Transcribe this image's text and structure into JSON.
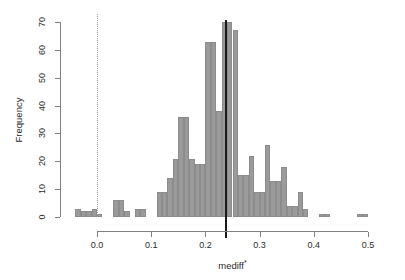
{
  "chart_data": {
    "type": "bar",
    "title": "",
    "subtitle": "",
    "xlabel": "mediff*",
    "xlabel_base": "mediff",
    "xlabel_sup": "*",
    "ylabel": "Frequency",
    "xlim": [
      -0.045,
      0.505
    ],
    "ylim": [
      0,
      72
    ],
    "grid": false,
    "legend": null,
    "bin_width": 0.01,
    "bar_fill_color": "#9a9a9a",
    "bar_border_color": "#8c8c8c",
    "axis_color": "#808080",
    "xticks": [
      {
        "value": 0.0,
        "label": "0.0"
      },
      {
        "value": 0.1,
        "label": "0.1"
      },
      {
        "value": 0.2,
        "label": "0.2"
      },
      {
        "value": 0.3,
        "label": "0.3"
      },
      {
        "value": 0.4,
        "label": "0.4"
      },
      {
        "value": 0.5,
        "label": "0.5"
      }
    ],
    "yticks": [
      {
        "value": 0,
        "label": "0"
      },
      {
        "value": 10,
        "label": "10"
      },
      {
        "value": 20,
        "label": "20"
      },
      {
        "value": 30,
        "label": "30"
      },
      {
        "value": 40,
        "label": "40"
      },
      {
        "value": 50,
        "label": "50"
      },
      {
        "value": 60,
        "label": "60"
      },
      {
        "value": 70,
        "label": "70"
      }
    ],
    "reference_lines": [
      {
        "name": "zero-line",
        "x": 0.0,
        "style": "dotted",
        "color": "#9a9a9a",
        "width": 1
      },
      {
        "name": "observed-line",
        "x": 0.237,
        "style": "solid",
        "color": "#1a1a1a",
        "width": 2
      }
    ],
    "bins": [
      {
        "x0": -0.04,
        "x1": -0.03,
        "count": 3
      },
      {
        "x0": -0.03,
        "x1": -0.02,
        "count": 2
      },
      {
        "x0": -0.02,
        "x1": -0.01,
        "count": 2
      },
      {
        "x0": -0.01,
        "x1": 0.0,
        "count": 3
      },
      {
        "x0": 0.0,
        "x1": 0.01,
        "count": 1
      },
      {
        "x0": 0.01,
        "x1": 0.02,
        "count": 0
      },
      {
        "x0": 0.02,
        "x1": 0.03,
        "count": 0
      },
      {
        "x0": 0.03,
        "x1": 0.04,
        "count": 6
      },
      {
        "x0": 0.04,
        "x1": 0.05,
        "count": 6
      },
      {
        "x0": 0.05,
        "x1": 0.06,
        "count": 2
      },
      {
        "x0": 0.06,
        "x1": 0.07,
        "count": 0
      },
      {
        "x0": 0.07,
        "x1": 0.08,
        "count": 3
      },
      {
        "x0": 0.08,
        "x1": 0.09,
        "count": 3
      },
      {
        "x0": 0.09,
        "x1": 0.1,
        "count": 0
      },
      {
        "x0": 0.1,
        "x1": 0.11,
        "count": 0
      },
      {
        "x0": 0.11,
        "x1": 0.12,
        "count": 9
      },
      {
        "x0": 0.12,
        "x1": 0.13,
        "count": 9
      },
      {
        "x0": 0.13,
        "x1": 0.14,
        "count": 14
      },
      {
        "x0": 0.14,
        "x1": 0.15,
        "count": 21
      },
      {
        "x0": 0.15,
        "x1": 0.16,
        "count": 36
      },
      {
        "x0": 0.16,
        "x1": 0.17,
        "count": 36
      },
      {
        "x0": 0.17,
        "x1": 0.18,
        "count": 21
      },
      {
        "x0": 0.18,
        "x1": 0.19,
        "count": 19
      },
      {
        "x0": 0.19,
        "x1": 0.2,
        "count": 19
      },
      {
        "x0": 0.2,
        "x1": 0.21,
        "count": 63
      },
      {
        "x0": 0.21,
        "x1": 0.22,
        "count": 63
      },
      {
        "x0": 0.22,
        "x1": 0.23,
        "count": 38
      },
      {
        "x0": 0.23,
        "x1": 0.24,
        "count": 70
      },
      {
        "x0": 0.24,
        "x1": 0.25,
        "count": 70
      },
      {
        "x0": 0.25,
        "x1": 0.26,
        "count": 67
      },
      {
        "x0": 0.26,
        "x1": 0.27,
        "count": 15
      },
      {
        "x0": 0.27,
        "x1": 0.28,
        "count": 15
      },
      {
        "x0": 0.28,
        "x1": 0.29,
        "count": 22
      },
      {
        "x0": 0.29,
        "x1": 0.3,
        "count": 9
      },
      {
        "x0": 0.3,
        "x1": 0.31,
        "count": 9
      },
      {
        "x0": 0.31,
        "x1": 0.32,
        "count": 26
      },
      {
        "x0": 0.32,
        "x1": 0.33,
        "count": 13
      },
      {
        "x0": 0.33,
        "x1": 0.34,
        "count": 13
      },
      {
        "x0": 0.34,
        "x1": 0.35,
        "count": 18
      },
      {
        "x0": 0.35,
        "x1": 0.36,
        "count": 4
      },
      {
        "x0": 0.36,
        "x1": 0.37,
        "count": 4
      },
      {
        "x0": 0.37,
        "x1": 0.38,
        "count": 9
      },
      {
        "x0": 0.38,
        "x1": 0.39,
        "count": 3
      },
      {
        "x0": 0.39,
        "x1": 0.4,
        "count": 0
      },
      {
        "x0": 0.4,
        "x1": 0.41,
        "count": 0
      },
      {
        "x0": 0.41,
        "x1": 0.42,
        "count": 1
      },
      {
        "x0": 0.42,
        "x1": 0.43,
        "count": 1
      },
      {
        "x0": 0.43,
        "x1": 0.44,
        "count": 0
      },
      {
        "x0": 0.48,
        "x1": 0.49,
        "count": 1
      },
      {
        "x0": 0.49,
        "x1": 0.5,
        "count": 1
      }
    ]
  }
}
